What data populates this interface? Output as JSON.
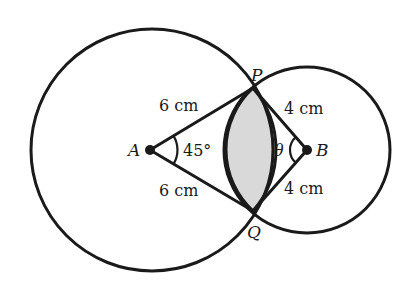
{
  "diagram": {
    "points": {
      "A": {
        "label": "A",
        "x": 150,
        "y": 150
      },
      "B": {
        "label": "B",
        "x": 307,
        "y": 150
      },
      "P": {
        "label": "P",
        "x": 253,
        "y": 88
      },
      "Q": {
        "label": "Q",
        "x": 253,
        "y": 211
      }
    },
    "circles": {
      "large": {
        "center_label": "A",
        "cx": 152,
        "cy": 150,
        "r": 121
      },
      "small": {
        "center_label": "B",
        "cx": 307,
        "cy": 150,
        "r": 83
      }
    },
    "lengths": {
      "AP": "6 cm",
      "AQ": "6 cm",
      "BP": "4 cm",
      "BQ": "4 cm"
    },
    "angles": {
      "PAQ": "45°",
      "PBQ": "θ"
    },
    "shaded_region": "lens between arcs PQ",
    "colors": {
      "stroke": "#1a1a1a",
      "shade": "#d9d9d9",
      "background": "#ffffff"
    }
  }
}
